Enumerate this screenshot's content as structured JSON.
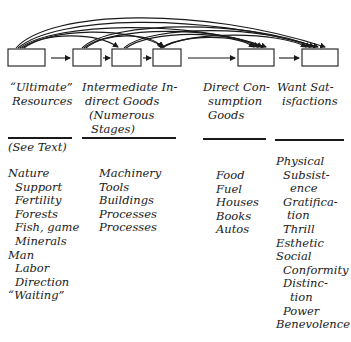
{
  "diagram": {
    "stages": [
      {
        "id": "ultimate_resources"
      },
      {
        "id": "intermediate_1"
      },
      {
        "id": "intermediate_2"
      },
      {
        "id": "intermediate_3"
      },
      {
        "id": "direct_consumption_goods"
      },
      {
        "id": "want_satisfactions"
      }
    ],
    "arrow_color": "#1a1a1a"
  },
  "columns": [
    {
      "header": [
        "“Ultimate”",
        "Resources"
      ],
      "items": [
        {
          "text": "Nature",
          "level": 0
        },
        {
          "text": "Support",
          "level": 1
        },
        {
          "text": "Fertility",
          "level": 1
        },
        {
          "text": "Forests",
          "level": 1
        },
        {
          "text": "Fish, game",
          "level": 1
        },
        {
          "text": "Minerals",
          "level": 1
        },
        {
          "text": "Man",
          "level": 0
        },
        {
          "text": "Labor",
          "level": 1
        },
        {
          "text": "Direction",
          "level": 1
        },
        {
          "text": "“Waiting”",
          "level": 0
        }
      ]
    },
    {
      "header": [
        "Intermediate In-",
        "direct Goods",
        "(Numerous",
        "Stages)"
      ],
      "items": [
        {
          "text": "Machinery",
          "level": 0
        },
        {
          "text": "Tools",
          "level": 0
        },
        {
          "text": "Buildings",
          "level": 0
        },
        {
          "text": "Processes",
          "level": 0
        },
        {
          "text": "Processes",
          "level": 0
        }
      ]
    },
    {
      "header": [
        "Direct Con-",
        "sumption",
        "Goods"
      ],
      "items": [
        {
          "text": "Food",
          "level": 0
        },
        {
          "text": "Fuel",
          "level": 0
        },
        {
          "text": "Houses",
          "level": 0
        },
        {
          "text": "Books",
          "level": 0
        },
        {
          "text": "Autos",
          "level": 0
        }
      ]
    },
    {
      "header": [
        "Want Sat-",
        "isfactions"
      ],
      "items": [
        {
          "text": "Physical",
          "level": 0
        },
        {
          "text": "Subsist-",
          "level": 1
        },
        {
          "text": "ence",
          "level": 2
        },
        {
          "text": "Gratifica-",
          "level": 1
        },
        {
          "text": "tion",
          "level": 2
        },
        {
          "text": "Thrill",
          "level": 1
        },
        {
          "text": "Esthetic",
          "level": 0
        },
        {
          "text": "Social",
          "level": 0
        },
        {
          "text": "Conformity",
          "level": 1
        },
        {
          "text": "Distinc-",
          "level": 1
        },
        {
          "text": "tion",
          "level": 2
        },
        {
          "text": "Power",
          "level": 1
        },
        {
          "text": "Benevolence",
          "level": 0
        }
      ]
    }
  ],
  "note": "(See Text)"
}
